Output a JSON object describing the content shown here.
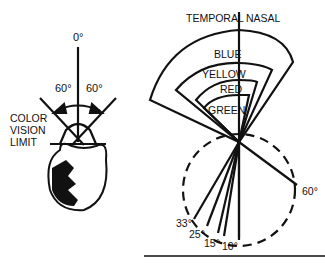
{
  "left_diagram": {
    "zero_label": "0°",
    "left_angle": "60°",
    "right_angle": "60°",
    "caption_lines": [
      "COLOR",
      "VISION",
      "LIMIT"
    ]
  },
  "right_diagram": {
    "temporal_label": "TEMPORAL",
    "nasal_label": "NASAL",
    "color_fields": [
      "BLUE",
      "YELLOW",
      "RED",
      "GREEN"
    ],
    "angles": [
      "60°",
      "33°",
      "25°",
      "15°",
      "10°"
    ]
  }
}
